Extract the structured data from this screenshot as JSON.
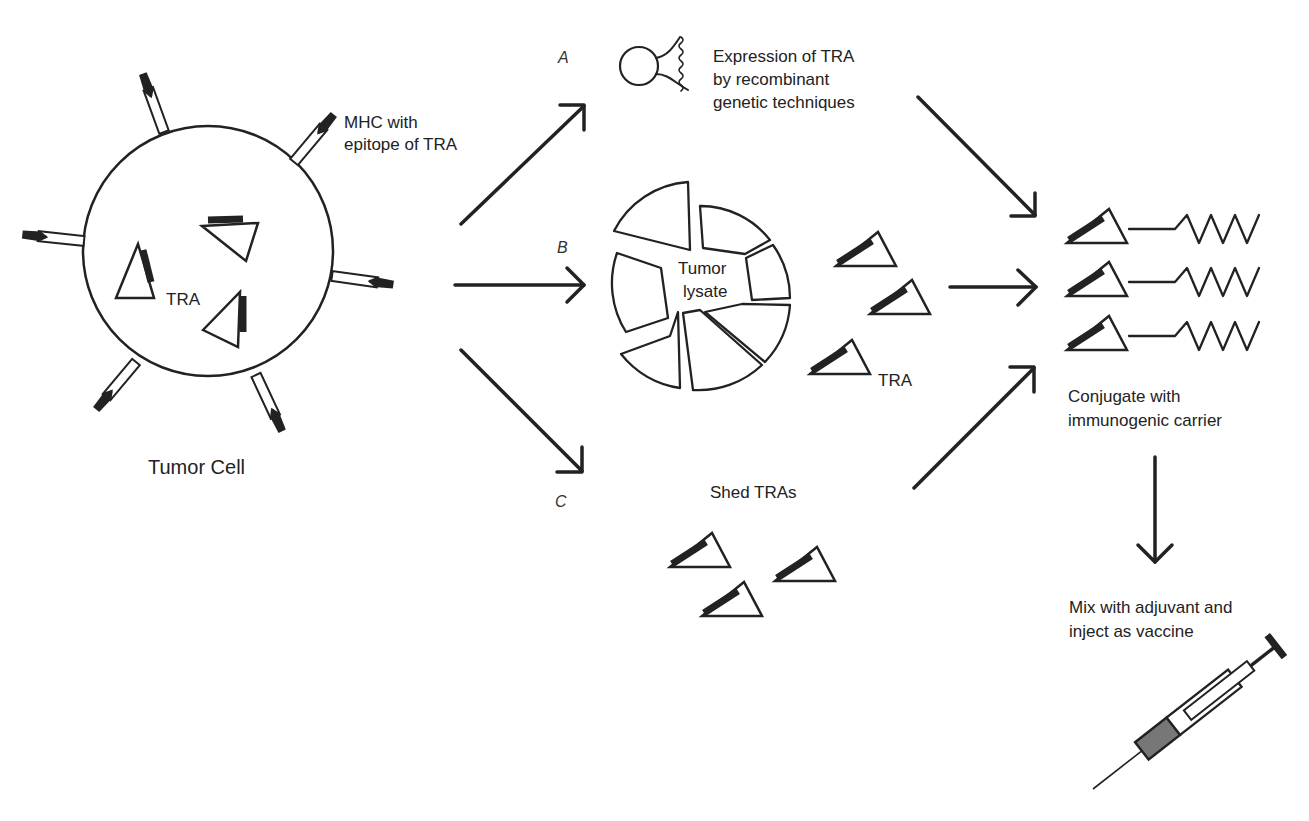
{
  "diagram": {
    "tumor_cell": {
      "label": "Tumor Cell",
      "inner_label": "TRA",
      "mhc_label_line1": "MHC with",
      "mhc_label_line2": "epitope of TRA"
    },
    "pathways": [
      {
        "letter": "A",
        "desc_line1": "Expression of TRA",
        "desc_line2": "by recombinant",
        "desc_line3": "genetic techniques"
      },
      {
        "letter": "B",
        "center_line1": "Tumor",
        "center_line2": "lysate",
        "tra_label": "TRA"
      },
      {
        "letter": "C",
        "desc_line1": "Shed TRAs"
      }
    ],
    "conjugate": {
      "line1": "Conjugate with",
      "line2": "immunogenic carrier"
    },
    "vaccine": {
      "line1": "Mix with adjuvant and",
      "line2": "inject as vaccine"
    },
    "colors": {
      "ink": "#222222",
      "background": "#ffffff",
      "syringe_fill": "#777777"
    }
  }
}
